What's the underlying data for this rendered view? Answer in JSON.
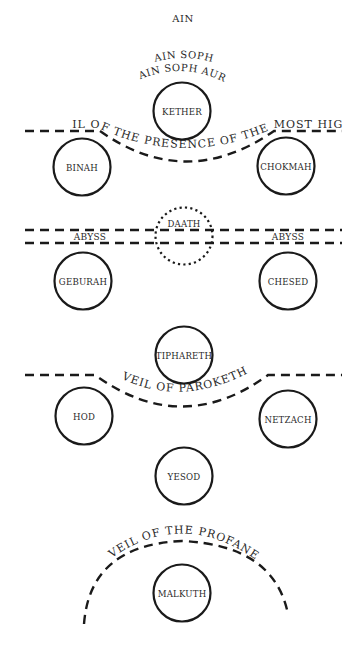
{
  "ain": {
    "line1": "AIN",
    "line2": "AIN SOPH",
    "line3": "AIN SOPH AUR"
  },
  "veils": {
    "most_high": "VEIL OF THE PRESENCE OF THE MOST HIGH",
    "paroketh": "VEIL OF PAROKETH",
    "profane": "VEIL OF THE PROFANE"
  },
  "abyss": {
    "left": "ABYSS",
    "right": "ABYSS"
  },
  "sephiroth": [
    {
      "id": "kether",
      "label": "KETHER",
      "style": "solid"
    },
    {
      "id": "binah",
      "label": "BINAH",
      "style": "solid"
    },
    {
      "id": "chokmah",
      "label": "CHOKMAH",
      "style": "solid"
    },
    {
      "id": "daath",
      "label": "DAATH",
      "style": "dotted"
    },
    {
      "id": "geburah",
      "label": "GEBURAH",
      "style": "solid"
    },
    {
      "id": "chesed",
      "label": "CHESED",
      "style": "solid"
    },
    {
      "id": "tiphareth",
      "label": "TIPHARETH",
      "style": "solid"
    },
    {
      "id": "hod",
      "label": "HOD",
      "style": "solid"
    },
    {
      "id": "netzach",
      "label": "NETZACH",
      "style": "solid"
    },
    {
      "id": "yesod",
      "label": "YESOD",
      "style": "solid"
    },
    {
      "id": "malkuth",
      "label": "MALKUTH",
      "style": "solid"
    }
  ]
}
